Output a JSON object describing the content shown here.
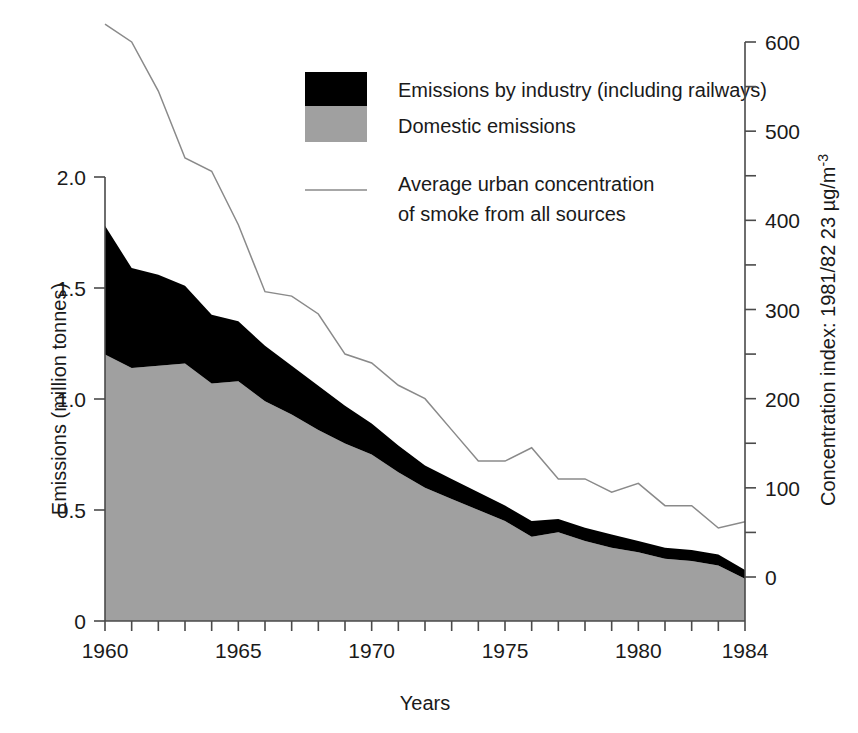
{
  "chart_data": {
    "type": "area",
    "title": "",
    "xlabel": "Years",
    "ylabel": "Emissions (million tonnes)",
    "y2label": "Concentration index: 1981/82 23 µg/m",
    "y2label_sup": "-3",
    "xlim": [
      1960,
      1984
    ],
    "ylim": [
      0,
      2.0
    ],
    "y2lim": [
      -20,
      600
    ],
    "grid": false,
    "legend_position": "top-center",
    "x": [
      1960,
      1961,
      1962,
      1963,
      1964,
      1965,
      1966,
      1967,
      1968,
      1969,
      1970,
      1971,
      1972,
      1973,
      1974,
      1975,
      1976,
      1977,
      1978,
      1979,
      1980,
      1981,
      1982,
      1983,
      1984
    ],
    "xticks": [
      1960,
      1965,
      1970,
      1975,
      1980,
      1984
    ],
    "xtick_labels": [
      "1960",
      "1965",
      "1970",
      "1975",
      "1980",
      "1984"
    ],
    "yticks": [
      0,
      0.5,
      1.0,
      1.5,
      2.0
    ],
    "ytick_labels": [
      "0",
      "0.5",
      "1.0",
      "1.5",
      "2.0"
    ],
    "y2ticks": [
      0,
      100,
      200,
      300,
      400,
      500,
      600
    ],
    "y2tick_labels": [
      "0",
      "100",
      "200",
      "300",
      "400",
      "500",
      "600"
    ],
    "y2minor_ticks": [
      -50,
      50,
      150,
      250,
      350,
      450,
      550
    ],
    "series": [
      {
        "name": "Domestic emissions",
        "type": "area-stacked",
        "color": "#a0a0a0",
        "values": [
          1.2,
          1.14,
          1.15,
          1.16,
          1.07,
          1.08,
          0.99,
          0.93,
          0.86,
          0.8,
          0.75,
          0.67,
          0.6,
          0.55,
          0.5,
          0.45,
          0.38,
          0.4,
          0.36,
          0.33,
          0.31,
          0.28,
          0.27,
          0.25,
          0.19
        ]
      },
      {
        "name": "Emissions by industry (including railways)",
        "type": "area-stacked",
        "color": "#000000",
        "values": [
          0.58,
          0.45,
          0.41,
          0.35,
          0.31,
          0.27,
          0.25,
          0.22,
          0.2,
          0.17,
          0.14,
          0.12,
          0.1,
          0.09,
          0.08,
          0.07,
          0.07,
          0.06,
          0.06,
          0.06,
          0.05,
          0.05,
          0.05,
          0.05,
          0.04
        ]
      },
      {
        "name": "Average urban concentration of smoke from all sources",
        "type": "line",
        "color": "#8a8a8a",
        "axis": "right",
        "values": [
          620,
          600,
          545,
          470,
          455,
          395,
          320,
          315,
          295,
          250,
          240,
          215,
          200,
          165,
          130,
          130,
          145,
          110,
          110,
          95,
          105,
          80,
          80,
          55,
          62
        ]
      }
    ]
  },
  "axes": {
    "left_title": "Emissions (million tonnes)",
    "bottom_title": "Years",
    "right_title": "Concentration index: 1981/82 23 µg/m",
    "right_title_sup": "-3"
  },
  "legend": {
    "entries": [
      {
        "label": "Emissions by industry (including railways)",
        "swatch": "black-square",
        "color": "#000000"
      },
      {
        "label": "Domestic emissions",
        "swatch": "gray-square",
        "color": "#a0a0a0"
      },
      {
        "label_line1": "Average urban concentration",
        "label_line2": "of smoke from all sources",
        "swatch": "line-sample",
        "color": "#8a8a8a"
      }
    ]
  }
}
